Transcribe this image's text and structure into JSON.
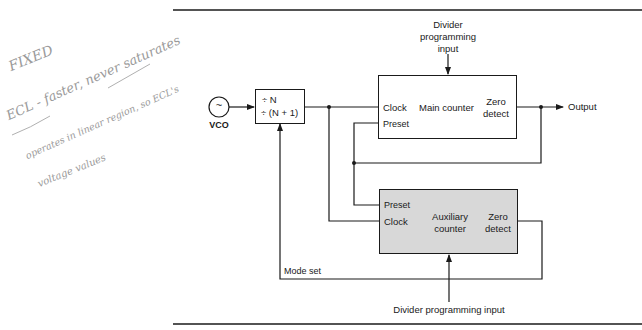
{
  "handwritten_notes": {
    "line1": "FIXED",
    "line2": "ECL - faster, never saturates",
    "line3": "operates in linear region, so ECL's",
    "line4": "voltage values"
  },
  "diagram": {
    "vco": {
      "symbol": "~",
      "label": "VCO"
    },
    "prescaler": {
      "line1": "÷ N",
      "line2": "÷ (N + 1)"
    },
    "main_counter": {
      "title": "Main counter",
      "clock": "Clock",
      "preset": "Preset",
      "zero_detect_line1": "Zero",
      "zero_detect_line2": "detect"
    },
    "aux_counter": {
      "title_line1": "Auxiliary",
      "title_line2": "counter",
      "preset": "Preset",
      "clock": "Clock",
      "zero_detect_line1": "Zero",
      "zero_detect_line2": "detect"
    },
    "top_input": {
      "line1": "Divider",
      "line2": "programming",
      "line3": "input"
    },
    "bottom_input": "Divider programming input",
    "output": "Output",
    "mode_set": "Mode set",
    "colors": {
      "line": "#1a1a1a",
      "aux_fill": "#d8d8d8",
      "handwriting": "#9a9a9a"
    }
  }
}
